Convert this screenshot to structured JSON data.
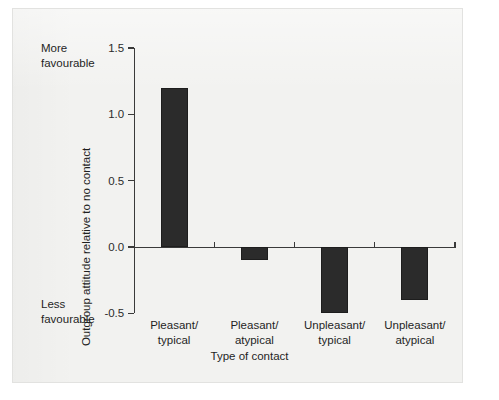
{
  "figure": {
    "background_color": "#f2f2f0",
    "border_color": "#e2e2e0",
    "bar_color": "#2b2b2b",
    "axis_color": "#3a3a3a",
    "text_color": "#1f1f1f"
  },
  "annotations": {
    "more_favourable": "More\nfavourable",
    "more_favourable_line1": "More",
    "more_favourable_line2": "favourable",
    "less_favourable_line1": "Less",
    "less_favourable_line2": "favourable"
  },
  "chart_data": {
    "type": "bar",
    "title": "",
    "subtitle": "",
    "xlabel": "Type of contact",
    "ylabel": "Outgroup attitude relative to no contact",
    "categories": [
      "Pleasant/\ntypical",
      "Pleasant/\natypical",
      "Unpleasant/\ntypical",
      "Unpleasant/\natypical"
    ],
    "category_lines": [
      [
        "Pleasant/",
        "typical"
      ],
      [
        "Pleasant/",
        "atypical"
      ],
      [
        "Unpleasant/",
        "typical"
      ],
      [
        "Unpleasant/",
        "atypical"
      ]
    ],
    "values": [
      1.2,
      -0.1,
      -0.5,
      -0.4
    ],
    "ylim": [
      -0.5,
      1.5
    ],
    "yticks": [
      -0.5,
      0.0,
      0.5,
      1.0,
      1.5
    ],
    "ytick_labels": [
      "-0.5",
      "0.0",
      "0.5",
      "1.0",
      "1.5"
    ],
    "grid": false,
    "legend": null,
    "legend_position": "none",
    "bar_color": "#2b2b2b",
    "baseline": 0.0,
    "annotations": [
      {
        "text": "More favourable",
        "position": "y-axis-top"
      },
      {
        "text": "Less favourable",
        "position": "y-axis-bottom"
      }
    ]
  }
}
